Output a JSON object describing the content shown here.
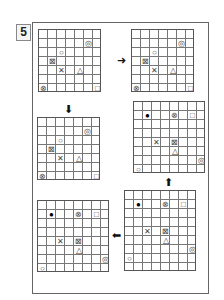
{
  "puzzle": {
    "number": "5",
    "grid_size": "7x7",
    "arrows": {
      "a1": "➜",
      "a2": "⬇",
      "a3": "⬆",
      "a4": "⬅"
    },
    "grids": [
      {
        "id": "top-left",
        "symbols": [
          {
            "type": "double-circle",
            "glyph": "◎",
            "col": 5,
            "row": 1
          },
          {
            "type": "circle",
            "glyph": "○",
            "col": 2,
            "row": 2
          },
          {
            "type": "boxed-x",
            "glyph": "⊠",
            "col": 1,
            "row": 3
          },
          {
            "type": "x",
            "glyph": "✕",
            "col": 2,
            "row": 4
          },
          {
            "type": "triangle",
            "glyph": "△",
            "col": 4,
            "row": 4
          },
          {
            "type": "circled-x",
            "glyph": "⊗",
            "col": 0,
            "row": 6
          },
          {
            "type": "square",
            "glyph": "□",
            "col": 6,
            "row": 6
          }
        ]
      },
      {
        "id": "top-right",
        "symbols": [
          {
            "type": "double-circle",
            "glyph": "◎",
            "col": 5,
            "row": 1
          },
          {
            "type": "circle",
            "glyph": "○",
            "col": 2,
            "row": 2
          },
          {
            "type": "boxed-x",
            "glyph": "⊠",
            "col": 1,
            "row": 3
          },
          {
            "type": "x",
            "glyph": "✕",
            "col": 2,
            "row": 4
          },
          {
            "type": "triangle",
            "glyph": "△",
            "col": 4,
            "row": 4
          },
          {
            "type": "circled-x",
            "glyph": "⊗",
            "col": 0,
            "row": 6
          },
          {
            "type": "square",
            "glyph": "□",
            "col": 6,
            "row": 6
          }
        ]
      },
      {
        "id": "middle-left",
        "symbols": [
          {
            "type": "double-circle",
            "glyph": "◎",
            "col": 5,
            "row": 1
          },
          {
            "type": "circle",
            "glyph": "○",
            "col": 2,
            "row": 2
          },
          {
            "type": "boxed-x",
            "glyph": "⊠",
            "col": 1,
            "row": 3
          },
          {
            "type": "x",
            "glyph": "✕",
            "col": 2,
            "row": 4
          },
          {
            "type": "triangle",
            "glyph": "△",
            "col": 4,
            "row": 4
          },
          {
            "type": "circled-x",
            "glyph": "⊗",
            "col": 0,
            "row": 6
          },
          {
            "type": "square",
            "glyph": "□",
            "col": 6,
            "row": 6
          }
        ]
      },
      {
        "id": "middle-right",
        "symbols": [
          {
            "type": "filled-circle",
            "glyph": "●",
            "col": 1,
            "row": 1
          },
          {
            "type": "circled-x",
            "glyph": "⊗",
            "col": 4,
            "row": 1
          },
          {
            "type": "square",
            "glyph": "□",
            "col": 6,
            "row": 1
          },
          {
            "type": "x",
            "glyph": "✕",
            "col": 2,
            "row": 4
          },
          {
            "type": "boxed-x",
            "glyph": "⊠",
            "col": 4,
            "row": 4
          },
          {
            "type": "triangle",
            "glyph": "△",
            "col": 4,
            "row": 5
          },
          {
            "type": "double-circle",
            "glyph": "◎",
            "col": 7,
            "row": 6
          },
          {
            "type": "circle",
            "glyph": "○",
            "col": 0,
            "row": 7
          }
        ]
      },
      {
        "id": "bottom-right",
        "symbols": [
          {
            "type": "filled-circle",
            "glyph": "●",
            "col": 1,
            "row": 1
          },
          {
            "type": "circled-x",
            "glyph": "⊗",
            "col": 4,
            "row": 1
          },
          {
            "type": "square",
            "glyph": "□",
            "col": 6,
            "row": 1
          },
          {
            "type": "x",
            "glyph": "✕",
            "col": 2,
            "row": 4
          },
          {
            "type": "boxed-x",
            "glyph": "⊠",
            "col": 4,
            "row": 4
          },
          {
            "type": "triangle",
            "glyph": "△",
            "col": 4,
            "row": 5
          },
          {
            "type": "double-circle",
            "glyph": "◎",
            "col": 7,
            "row": 6
          },
          {
            "type": "circle",
            "glyph": "○",
            "col": 0,
            "row": 7
          }
        ]
      },
      {
        "id": "bottom-left",
        "symbols": [
          {
            "type": "filled-circle",
            "glyph": "●",
            "col": 1,
            "row": 1
          },
          {
            "type": "circled-x",
            "glyph": "⊗",
            "col": 4,
            "row": 1
          },
          {
            "type": "square",
            "glyph": "□",
            "col": 6,
            "row": 1
          },
          {
            "type": "x",
            "glyph": "✕",
            "col": 2,
            "row": 4
          },
          {
            "type": "boxed-x",
            "glyph": "⊠",
            "col": 4,
            "row": 4
          },
          {
            "type": "triangle",
            "glyph": "△",
            "col": 4,
            "row": 5
          },
          {
            "type": "double-circle",
            "glyph": "◎",
            "col": 7,
            "row": 6
          },
          {
            "type": "circle",
            "glyph": "○",
            "col": 0,
            "row": 7
          }
        ]
      }
    ]
  }
}
